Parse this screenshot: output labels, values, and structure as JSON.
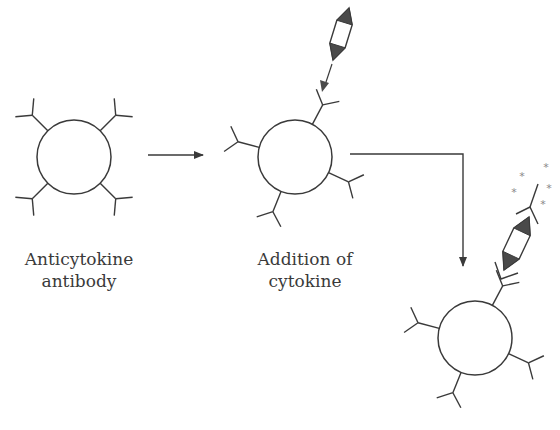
{
  "diagram": {
    "type": "process-flow",
    "colors": {
      "line": "#3a3a3a",
      "fill_dark": "#4a4a4a",
      "star": "#8a8a8a",
      "background": "#ffffff"
    },
    "steps": [
      {
        "id": "step-1",
        "label_lines": [
          "Anticytokine",
          "antibody"
        ],
        "bead": "capture bead with anticytokine antibodies",
        "antibody_count": 4
      },
      {
        "id": "step-2",
        "label_lines": [
          "Addition of",
          "cytokine"
        ],
        "bead": "capture bead binding cytokine",
        "antibody_count": 4,
        "cytokine_bound": true
      },
      {
        "id": "step-3",
        "label_lines": [],
        "bead": "bead with cytokine sandwiched by fluorescent detection antibody",
        "antibody_count": 4,
        "detection_antibody": true,
        "fluorescent_marks": 5
      }
    ],
    "arrows": [
      {
        "from": "step-1",
        "to": "step-2",
        "shape": "straight"
      },
      {
        "from": "step-2",
        "to": "step-3",
        "shape": "elbow"
      }
    ]
  },
  "labels": {
    "step1_line1": "Anticytokine",
    "step1_line2": "antibody",
    "step2_line1": "Addition of",
    "step2_line2": "cytokine"
  }
}
